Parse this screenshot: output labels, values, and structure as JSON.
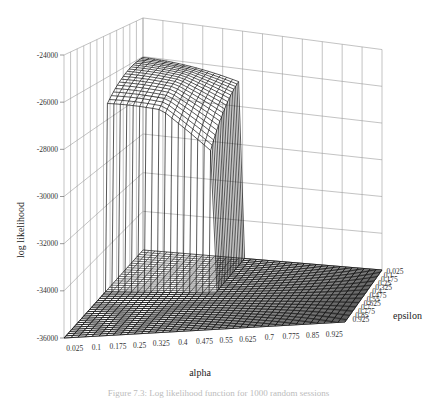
{
  "chart_data": {
    "type": "surface3d",
    "title": "",
    "xlabel": "alpha",
    "ylabel": "epsilon",
    "zlabel": "log likelihood",
    "x_ticks": [
      "0.025",
      "0.1",
      "0.175",
      "0.25",
      "0.325",
      "0.4",
      "0.475",
      "0.55",
      "0.625",
      "0.7",
      "0.775",
      "0.85",
      "0.925"
    ],
    "y_ticks": [
      "0.025",
      "0.1",
      "0.175",
      "0.25",
      "0.325",
      "0.4",
      "0.475",
      "0.55",
      "0.625",
      "0.7",
      "0.775",
      "0.85",
      "0.925"
    ],
    "z_ticks": [
      "-24000",
      "-26000",
      "-28000",
      "-30000",
      "-32000",
      "-34000",
      "-36000"
    ],
    "zlim": [
      -36000,
      -24000
    ],
    "grid": true,
    "peak": {
      "z": -26000,
      "alpha_range": [
        0.025,
        0.4
      ],
      "epsilon_range": [
        0.025,
        0.4
      ]
    },
    "floor_value": -36000
  },
  "caption": "Figure 7.3: Log likelihood function for 1000 random sessions"
}
